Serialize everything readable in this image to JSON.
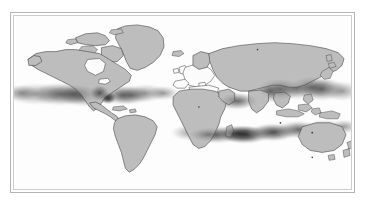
{
  "figure": {
    "title": "World map with shaded tropical density bands",
    "projection": "equirectangular",
    "background_color": "#ffffff",
    "frame_outer_color": "#b4b4b4",
    "frame_inner_color": "#cdcdcd",
    "land_fill_color": "#bdbdbd",
    "land_outline_color": "#3a3a3a",
    "ocean_color": "#ffffff",
    "shading_color": "#555555"
  },
  "map": {
    "name": "world-map",
    "continents": [
      {
        "name": "north-america",
        "label": "North America"
      },
      {
        "name": "south-america",
        "label": "South America"
      },
      {
        "name": "greenland",
        "label": "Greenland"
      },
      {
        "name": "europe",
        "label": "Europe"
      },
      {
        "name": "africa",
        "label": "Africa"
      },
      {
        "name": "asia",
        "label": "Asia"
      },
      {
        "name": "australia",
        "label": "Australia"
      },
      {
        "name": "new-zealand",
        "label": "New Zealand"
      },
      {
        "name": "japan",
        "label": "Japan"
      },
      {
        "name": "southeast-asia-islands",
        "label": "Southeast Asia Islands"
      },
      {
        "name": "british-isles",
        "label": "British Isles"
      },
      {
        "name": "madagascar",
        "label": "Madagascar"
      },
      {
        "name": "iceland",
        "label": "Iceland"
      },
      {
        "name": "caribbean",
        "label": "Caribbean"
      }
    ]
  },
  "shading": {
    "description": "Diffuse dark gray density bands across tropical and subtropical latitudes",
    "regions": [
      {
        "name": "east-pacific-band",
        "intensity": "medium"
      },
      {
        "name": "central-america-hotspot",
        "intensity": "high"
      },
      {
        "name": "atlantic-band",
        "intensity": "medium"
      },
      {
        "name": "west-pacific-band",
        "intensity": "medium-high"
      },
      {
        "name": "southern-indian-ocean-band",
        "intensity": "high"
      },
      {
        "name": "south-asia-band",
        "intensity": "medium"
      },
      {
        "name": "east-asia-band",
        "intensity": "medium"
      }
    ]
  }
}
